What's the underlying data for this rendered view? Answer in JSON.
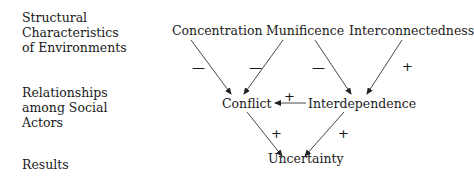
{
  "rows": {
    "structural": [
      "Structural",
      "Characteristics",
      "of Environments"
    ],
    "relationships": [
      "Relationships",
      "among Social",
      "Actors"
    ],
    "results": [
      "Results"
    ]
  },
  "nodes": {
    "concentration": "Concentration",
    "munificence": "Munificence",
    "interconnectedness": "Interconnectedness",
    "conflict": "Conflict",
    "interdependence": "Interdependence",
    "uncertainty": "Uncertainty"
  },
  "edges": [
    {
      "from": "Concentration",
      "to": "Conflict",
      "sign": "—"
    },
    {
      "from": "Munificence",
      "to": "Conflict",
      "sign": "—"
    },
    {
      "from": "Munificence",
      "to": "Interdependence",
      "sign": "—"
    },
    {
      "from": "Interconnectedness",
      "to": "Interdependence",
      "sign": "+"
    },
    {
      "from": "Interdependence",
      "to": "Conflict",
      "sign": "+"
    },
    {
      "from": "Conflict",
      "to": "Uncertainty",
      "sign": "+"
    },
    {
      "from": "Interdependence",
      "to": "Uncertainty",
      "sign": "+"
    }
  ],
  "signs": {
    "conc_conf": "—",
    "muni_conf": "—",
    "muni_inter": "—",
    "interc_inter": "+",
    "inter_conf": "+",
    "conf_unc": "+",
    "inter_unc": "+"
  }
}
